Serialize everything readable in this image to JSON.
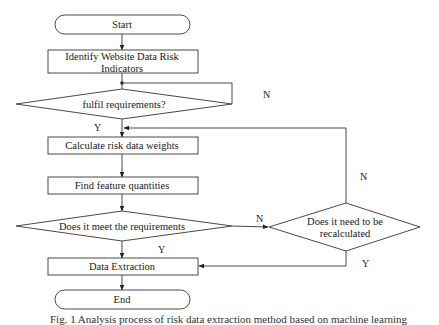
{
  "diagram": {
    "type": "flowchart",
    "nodes": {
      "start": {
        "label": "Start",
        "shape": "terminal"
      },
      "identify": {
        "label_line1": "Identify Website Data Risk",
        "label_line2": "Indicators",
        "shape": "process"
      },
      "fulfil": {
        "label": "fulfil requirements?",
        "shape": "decision"
      },
      "calculate": {
        "label": "Calculate risk data weights",
        "shape": "process"
      },
      "find": {
        "label": "Find feature quantities",
        "shape": "process"
      },
      "meet": {
        "label": "Does it meet the requirements",
        "shape": "decision"
      },
      "recalc": {
        "label_line1": "Does it need to be",
        "label_line2": "recalculated",
        "shape": "decision"
      },
      "extract": {
        "label": "Data Extraction",
        "shape": "process"
      },
      "end": {
        "label": "End",
        "shape": "terminal"
      }
    },
    "edges": [
      {
        "from": "start",
        "to": "identify",
        "label": ""
      },
      {
        "from": "identify",
        "to": "fulfil",
        "label": ""
      },
      {
        "from": "fulfil",
        "to": "identify-junction",
        "label": "N"
      },
      {
        "from": "fulfil",
        "to": "calculate",
        "label": "Y"
      },
      {
        "from": "calculate",
        "to": "find",
        "label": ""
      },
      {
        "from": "find",
        "to": "meet",
        "label": ""
      },
      {
        "from": "meet",
        "to": "recalc",
        "label": "N"
      },
      {
        "from": "meet",
        "to": "extract",
        "label": "Y"
      },
      {
        "from": "recalc",
        "to": "calculate",
        "label": "N"
      },
      {
        "from": "recalc",
        "to": "extract",
        "label": "Y"
      },
      {
        "from": "extract",
        "to": "end",
        "label": ""
      }
    ],
    "edge_labels": {
      "fulfil_n": "N",
      "fulfil_y": "Y",
      "meet_n": "N",
      "meet_y": "Y",
      "recalc_n": "N",
      "recalc_y": "Y"
    },
    "colors": {
      "stroke": "#4a4a4a",
      "background": "#ffffff",
      "text": "#1a1a1a"
    }
  },
  "caption": "Fig. 1 Analysis process of risk data extraction method based on machine learning"
}
